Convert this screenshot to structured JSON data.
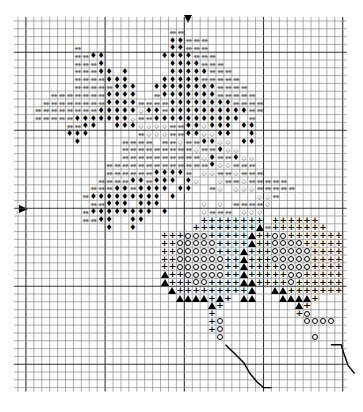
{
  "grid": {
    "cols": 41,
    "rows": 47,
    "cell_w": 7.92,
    "cell_h": 7.8,
    "major_every": 10,
    "line_color": "#000000"
  },
  "center_markers": {
    "top_col": 21,
    "left_row": 24
  },
  "legend": {
    "d": "double-diamond (gray)",
    "B": "filled diamond",
    "o": "open diamond",
    "+": "plus",
    "O": "open circle",
    "A": "filled triangle"
  },
  "rows": [
    ".........................................",
    "...................dd....................",
    "...................BBddd.................",
    ".......d...........BBddd.................",
    ".......ddBB.......BBBBddd................",
    ".......dddB........BBBBddd...............",
    ".......dddBB.B.....BBBBBddd..............",
    ".......ddddBBB....BBBBBddddd.............",
    ".......dddddBBB..BBBBBBBBdddd............",
    "....dddddddBBBB..dBBBBBBBddddd...........",
    "...ddddddddBBBBddddBBBBBBBBdddd..........",
    "..ddddddddBBBBBoBBdBBBBBBBBBBdd..........",
    "..dddddBBBBBBBoddBBBBBBBBBBB.d...........",
    "......ddBB..BBBooooddBBoBBB.BB...........",
    "......BBB......doooddBBooBB..B...........",
    ".......B.....dddd.ddoddBBoo.BB...........",
    ".............dddddddddoddBoo.............",
    ".............ddddddddddoBddBoo...........",
    "...........dddddddddddddBooddd...........",
    "...........ddddddBBBBd.ooddoddd..........",
    "..........ddddBBdBBB.Bo..oddoddddd.......",
    ".........dddBBdBBBB.BB..do.oooddddd......",
    "........dBBBBBBBBB.B..........ood........",
    ".........ddBBB.BBB.....o.o.ddddo.........",
    "........dBBBBBBBB.B....oddd.ooo..........",
    "........ddBB..BB.......++++++++.++++++...",
    "...........B..B.......++++++++Ad+++++++..",
    "..................+++OOO+++++A++OO+++++++",
    "..................++OOOOO++++A++OOOO+++++",
    "..................++OOOOO+++A+++OOOOO++++",
    "..................++OOOOOO++A+++OOOOO++++",
    "..................++OOOOOO++A++++OOOO++++",
    "..................A++OOOOO++A+++++OO+++++",
    "..................A+++OO++++AA++++O++++++",
    "...................A+++++++++A..AA+++++++",
    "....................AAAA+A+.AA...AAAA+...",
    "........................A+.........A+....",
    "........................+..........+O....",
    "........................+O..........OOOO.",
    "........................+O...............",
    ".........................O...........O...",
    ".........................................",
    ".........................................",
    ".........................................",
    ".........................................",
    ".........................................",
    "........................................."
  ],
  "lines": [
    {
      "points": [
        [
          26.2,
          41.5
        ],
        [
          27.5,
          42.8
        ],
        [
          28.5,
          43.8
        ],
        [
          29.3,
          45.2
        ],
        [
          30.2,
          46.3
        ],
        [
          31,
          47.0
        ],
        [
          32,
          47.0
        ]
      ]
    },
    {
      "points": [
        [
          39.5,
          41.5
        ],
        [
          40.8,
          41.5
        ],
        [
          41.2,
          42.8
        ],
        [
          41.7,
          44.2
        ],
        [
          42.5,
          45.2
        ]
      ]
    }
  ],
  "symbols": {
    "B": "♦",
    "d": "◈◈",
    "o": "◇",
    "+": "+"
  }
}
